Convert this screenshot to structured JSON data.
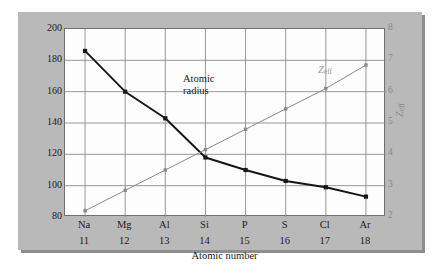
{
  "chart_data": {
    "type": "line",
    "title": "",
    "xlabel": "Atomic number",
    "ylabel": "Atomic radius (pm)",
    "y2label": "Zeff",
    "categories": [
      "Na",
      "Mg",
      "Al",
      "Si",
      "P",
      "S",
      "Cl",
      "Ar"
    ],
    "atomic_numbers": [
      11,
      12,
      13,
      14,
      15,
      16,
      17,
      18
    ],
    "ylim": [
      80,
      200
    ],
    "y2lim": [
      2,
      8
    ],
    "yticks": [
      200,
      180,
      160,
      140,
      120,
      100,
      80
    ],
    "y2ticks": [
      8,
      7,
      6,
      5,
      4,
      3,
      2
    ],
    "grid": true,
    "legend": "inline-annotations",
    "series": [
      {
        "name": "Atomic radius",
        "axis": "left",
        "color": "#161616",
        "units": "pm",
        "values": [
          186,
          160,
          143,
          118,
          110,
          103,
          99,
          93
        ]
      },
      {
        "name": "Zeff",
        "axis": "right",
        "color": "#8a8a8a",
        "units": "",
        "values": [
          2.2,
          2.85,
          3.5,
          4.15,
          4.8,
          5.45,
          6.1,
          6.85
        ]
      }
    ],
    "annotations": [
      {
        "text": "Atomic radius",
        "series": "Atomic radius"
      },
      {
        "text": "Zeff",
        "series": "Zeff"
      }
    ]
  },
  "axes": {
    "y_title": "Atomic radius (pm)",
    "y_ticks": [
      "200",
      "180",
      "160",
      "140",
      "120",
      "100",
      "80"
    ],
    "y2_title_base": "Z",
    "y2_title_sub": "eff",
    "y2_ticks": [
      "8",
      "7",
      "6",
      "5",
      "4",
      "3",
      "2"
    ],
    "x_title": "Atomic number",
    "x_symbols": [
      "Na",
      "Mg",
      "Al",
      "Si",
      "P",
      "S",
      "Cl",
      "Ar"
    ],
    "x_numbers": [
      "11",
      "12",
      "13",
      "14",
      "15",
      "16",
      "17",
      "18"
    ]
  },
  "annotations": {
    "radius_line1": "Atomic",
    "radius_line2": "radius",
    "zeff_base": "Z",
    "zeff_sub": "eff"
  },
  "colors": {
    "panel": "#b9b9b9",
    "panel_shadow": "#8e8e8e",
    "plot_background": "#fdfdfd",
    "grid": "#8c8c8c",
    "frame": "#6f6f6f",
    "radius_series": "#161616",
    "zeff_series": "#8a8a8a",
    "text": "#1c1c1c"
  }
}
